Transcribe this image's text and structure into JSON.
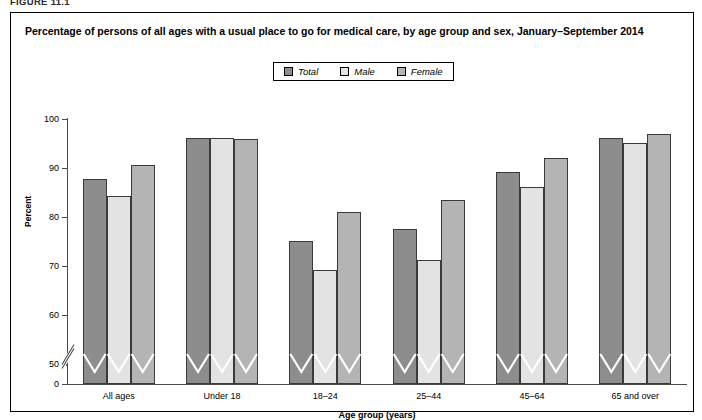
{
  "figure_label": "FIGURE 11.1",
  "chart_title": "Percentage of persons of all ages with a usual place to go for medical care, by age group and sex, January–September 2014",
  "colors": {
    "total": "#8d8d8d",
    "male": "#e3e3e3",
    "female": "#b4b4b4",
    "bar_outline": "#3a3a3a",
    "axis": "#4a4a4a",
    "frame": "#000000"
  },
  "legend": {
    "entries": [
      {
        "label": "Total",
        "swatch": "total"
      },
      {
        "label": "Male",
        "swatch": "male"
      },
      {
        "label": "Female",
        "swatch": "female"
      }
    ]
  },
  "chart_data": {
    "type": "bar",
    "title": "Percentage of persons of all ages with a usual place to go for medical care, by age group and sex, January–September 2014",
    "xlabel": "Age group (years)",
    "ylabel": "Percent",
    "categories": [
      "All ages",
      "Under 18",
      "18–24",
      "25–44",
      "45–64",
      "65 and over"
    ],
    "series": [
      {
        "name": "Total",
        "values": [
          87.8,
          96.1,
          75.2,
          77.6,
          89.2,
          96.1
        ]
      },
      {
        "name": "Male",
        "values": [
          84.4,
          96.1,
          69.2,
          71.3,
          86.1,
          95.2
        ]
      },
      {
        "name": "Female",
        "values": [
          90.7,
          95.9,
          81.0,
          83.5,
          92.0,
          96.9
        ]
      }
    ],
    "ylim": [
      0,
      100
    ],
    "ytick_values": [
      0,
      50,
      60,
      70,
      80,
      90,
      100
    ],
    "ytick_labels": [
      "0",
      "50",
      "60",
      "70",
      "80",
      "90",
      "100"
    ],
    "axis_break": true,
    "axis_break_between": [
      0,
      50
    ],
    "grid": false,
    "legend_position": "top-center"
  }
}
